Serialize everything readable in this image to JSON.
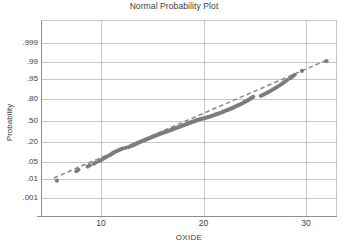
{
  "chart_data": {
    "type": "scatter",
    "title": "Normal Probability Plot",
    "xlabel": "OXIDE",
    "ylabel": "Probability",
    "grid": true,
    "legend": false,
    "xlim": [
      4.2,
      33.2
    ],
    "x_ticks": [
      {
        "label": "10",
        "value": 10
      },
      {
        "label": "20",
        "value": 20
      },
      {
        "label": "30",
        "value": 30
      }
    ],
    "y_scale": "normal-probability",
    "y_ticks": [
      {
        "label": ".999",
        "value": 0.999
      },
      {
        "label": ".99",
        "value": 0.99
      },
      {
        "label": ".95",
        "value": 0.95
      },
      {
        "label": ".80",
        "value": 0.8
      },
      {
        "label": ".50",
        "value": 0.5
      },
      {
        "label": ".20",
        "value": 0.2
      },
      {
        "label": ".05",
        "value": 0.05
      },
      {
        "label": ".01",
        "value": 0.01
      },
      {
        "label": ".001",
        "value": 0.001
      }
    ],
    "point_color": "#7d7d7d",
    "reference_line": {
      "style": "dashed",
      "color": "#8a8a8a",
      "x_start": 5.4,
      "y_start": 0.011,
      "x_end": 32.3,
      "y_end": 0.993
    },
    "annotations": [],
    "points": [
      {
        "x": 5.7,
        "y": 0.0082
      },
      {
        "x": 7.6,
        "y": 0.0215
      },
      {
        "x": 7.8,
        "y": 0.0248
      },
      {
        "x": 8.7,
        "y": 0.033
      },
      {
        "x": 8.9,
        "y": 0.0368
      },
      {
        "x": 9.3,
        "y": 0.0425
      },
      {
        "x": 9.5,
        "y": 0.047
      },
      {
        "x": 9.8,
        "y": 0.052
      },
      {
        "x": 10.0,
        "y": 0.057
      },
      {
        "x": 10.2,
        "y": 0.063
      },
      {
        "x": 10.4,
        "y": 0.069
      },
      {
        "x": 10.6,
        "y": 0.0755
      },
      {
        "x": 10.8,
        "y": 0.082
      },
      {
        "x": 11.0,
        "y": 0.089
      },
      {
        "x": 11.15,
        "y": 0.096
      },
      {
        "x": 11.3,
        "y": 0.103
      },
      {
        "x": 11.5,
        "y": 0.11
      },
      {
        "x": 11.7,
        "y": 0.117
      },
      {
        "x": 11.9,
        "y": 0.124
      },
      {
        "x": 12.1,
        "y": 0.131
      },
      {
        "x": 12.4,
        "y": 0.138
      },
      {
        "x": 12.7,
        "y": 0.145
      },
      {
        "x": 12.9,
        "y": 0.1525
      },
      {
        "x": 13.1,
        "y": 0.16
      },
      {
        "x": 13.25,
        "y": 0.1675
      },
      {
        "x": 13.4,
        "y": 0.175
      },
      {
        "x": 13.55,
        "y": 0.1825
      },
      {
        "x": 13.7,
        "y": 0.19
      },
      {
        "x": 13.85,
        "y": 0.1975
      },
      {
        "x": 14.0,
        "y": 0.205
      },
      {
        "x": 14.2,
        "y": 0.213
      },
      {
        "x": 14.35,
        "y": 0.221
      },
      {
        "x": 14.5,
        "y": 0.229
      },
      {
        "x": 14.65,
        "y": 0.237
      },
      {
        "x": 14.8,
        "y": 0.245
      },
      {
        "x": 14.95,
        "y": 0.253
      },
      {
        "x": 15.1,
        "y": 0.261
      },
      {
        "x": 15.25,
        "y": 0.269
      },
      {
        "x": 15.4,
        "y": 0.277
      },
      {
        "x": 15.55,
        "y": 0.285
      },
      {
        "x": 15.7,
        "y": 0.293
      },
      {
        "x": 15.85,
        "y": 0.301
      },
      {
        "x": 16.0,
        "y": 0.309
      },
      {
        "x": 16.15,
        "y": 0.317
      },
      {
        "x": 16.3,
        "y": 0.325
      },
      {
        "x": 16.45,
        "y": 0.333
      },
      {
        "x": 16.6,
        "y": 0.341
      },
      {
        "x": 16.75,
        "y": 0.349
      },
      {
        "x": 16.9,
        "y": 0.357
      },
      {
        "x": 17.0,
        "y": 0.365
      },
      {
        "x": 17.15,
        "y": 0.373
      },
      {
        "x": 17.3,
        "y": 0.381
      },
      {
        "x": 17.45,
        "y": 0.389
      },
      {
        "x": 17.6,
        "y": 0.397
      },
      {
        "x": 17.7,
        "y": 0.405
      },
      {
        "x": 17.85,
        "y": 0.413
      },
      {
        "x": 18.0,
        "y": 0.421
      },
      {
        "x": 18.1,
        "y": 0.429
      },
      {
        "x": 18.25,
        "y": 0.437
      },
      {
        "x": 18.4,
        "y": 0.445
      },
      {
        "x": 18.5,
        "y": 0.453
      },
      {
        "x": 18.65,
        "y": 0.461
      },
      {
        "x": 18.8,
        "y": 0.469
      },
      {
        "x": 18.9,
        "y": 0.477
      },
      {
        "x": 19.05,
        "y": 0.485
      },
      {
        "x": 19.2,
        "y": 0.493
      },
      {
        "x": 19.3,
        "y": 0.501
      },
      {
        "x": 19.45,
        "y": 0.509
      },
      {
        "x": 19.6,
        "y": 0.517
      },
      {
        "x": 19.8,
        "y": 0.525
      },
      {
        "x": 20.0,
        "y": 0.533
      },
      {
        "x": 20.2,
        "y": 0.542
      },
      {
        "x": 20.4,
        "y": 0.55
      },
      {
        "x": 20.55,
        "y": 0.558
      },
      {
        "x": 20.7,
        "y": 0.566
      },
      {
        "x": 20.85,
        "y": 0.5745
      },
      {
        "x": 21.0,
        "y": 0.583
      },
      {
        "x": 21.15,
        "y": 0.5915
      },
      {
        "x": 21.3,
        "y": 0.6
      },
      {
        "x": 21.45,
        "y": 0.6085
      },
      {
        "x": 21.6,
        "y": 0.617
      },
      {
        "x": 21.75,
        "y": 0.6255
      },
      {
        "x": 21.9,
        "y": 0.634
      },
      {
        "x": 22.0,
        "y": 0.6425
      },
      {
        "x": 22.15,
        "y": 0.651
      },
      {
        "x": 22.3,
        "y": 0.66
      },
      {
        "x": 22.45,
        "y": 0.669
      },
      {
        "x": 22.6,
        "y": 0.678
      },
      {
        "x": 22.75,
        "y": 0.687
      },
      {
        "x": 22.9,
        "y": 0.696
      },
      {
        "x": 23.0,
        "y": 0.705
      },
      {
        "x": 23.15,
        "y": 0.714
      },
      {
        "x": 23.3,
        "y": 0.723
      },
      {
        "x": 23.45,
        "y": 0.732
      },
      {
        "x": 23.6,
        "y": 0.7415
      },
      {
        "x": 23.75,
        "y": 0.751
      },
      {
        "x": 23.9,
        "y": 0.7605
      },
      {
        "x": 24.0,
        "y": 0.77
      },
      {
        "x": 24.15,
        "y": 0.7795
      },
      {
        "x": 24.3,
        "y": 0.789
      },
      {
        "x": 24.45,
        "y": 0.7985
      },
      {
        "x": 24.6,
        "y": 0.808
      },
      {
        "x": 24.7,
        "y": 0.8175
      },
      {
        "x": 24.85,
        "y": 0.827
      },
      {
        "x": 25.6,
        "y": 0.837
      },
      {
        "x": 25.8,
        "y": 0.8465
      },
      {
        "x": 26.0,
        "y": 0.856
      },
      {
        "x": 26.2,
        "y": 0.8655
      },
      {
        "x": 26.4,
        "y": 0.875
      },
      {
        "x": 26.6,
        "y": 0.884
      },
      {
        "x": 26.8,
        "y": 0.893
      },
      {
        "x": 27.0,
        "y": 0.902
      },
      {
        "x": 27.2,
        "y": 0.9105
      },
      {
        "x": 27.4,
        "y": 0.9185
      },
      {
        "x": 27.6,
        "y": 0.9265
      },
      {
        "x": 27.8,
        "y": 0.934
      },
      {
        "x": 28.0,
        "y": 0.941
      },
      {
        "x": 28.2,
        "y": 0.948
      },
      {
        "x": 28.5,
        "y": 0.9545
      },
      {
        "x": 28.7,
        "y": 0.9605
      },
      {
        "x": 28.9,
        "y": 0.966
      },
      {
        "x": 29.6,
        "y": 0.976
      },
      {
        "x": 32.0,
        "y": 0.991
      }
    ]
  }
}
